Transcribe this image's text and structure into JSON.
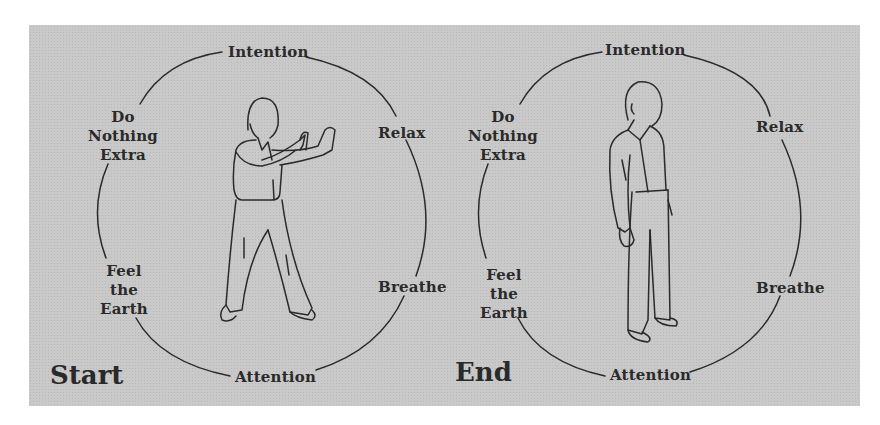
{
  "figure": {
    "background_color": "#c9c9c9",
    "line_color": "#2a2a2a",
    "panels": [
      {
        "title": "Start",
        "pose": "standing-push-hands-posture",
        "labels": {
          "top": "Intention",
          "upper_right": "Relax",
          "lower_right": "Breathe",
          "bottom": "Attention",
          "lower_left": [
            "Feel",
            "the",
            "Earth"
          ],
          "upper_left": [
            "Do",
            "Nothing",
            "Extra"
          ]
        }
      },
      {
        "title": "End",
        "pose": "standing-relaxed-posture",
        "labels": {
          "top": "Intention",
          "upper_right": "Relax",
          "lower_right": "Breathe",
          "bottom": "Attention",
          "lower_left": [
            "Feel",
            "the",
            "Earth"
          ],
          "upper_left": [
            "Do",
            "Nothing",
            "Extra"
          ]
        }
      }
    ]
  }
}
